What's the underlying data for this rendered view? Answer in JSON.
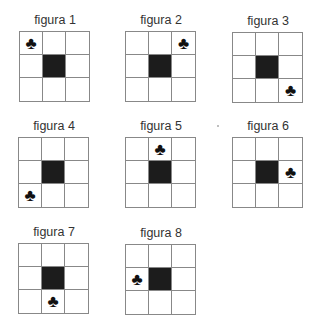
{
  "header_partial": [
    "",
    ""
  ],
  "figures": [
    {
      "label": "figura 1",
      "club": [
        0,
        0
      ]
    },
    {
      "label": "figura 2",
      "club": [
        0,
        2
      ]
    },
    {
      "label": "figura 3",
      "club": [
        2,
        2
      ]
    },
    {
      "label": "figura 4",
      "club": [
        2,
        0
      ]
    },
    {
      "label": "figura 5",
      "club": [
        0,
        1
      ]
    },
    {
      "label": "figura 6",
      "club": [
        1,
        2
      ]
    },
    {
      "label": "figura 7",
      "club": [
        2,
        1
      ]
    },
    {
      "label": "figura 8",
      "club": [
        1,
        0
      ]
    }
  ],
  "symbols": {
    "club": "♣"
  },
  "colors": {
    "center": "#1c1c1c",
    "grid_line": "#888888"
  }
}
